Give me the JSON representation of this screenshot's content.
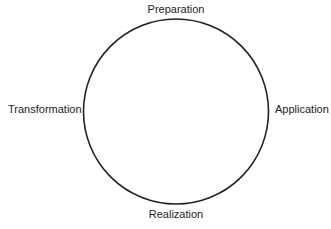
{
  "diagram": {
    "type": "cycle",
    "shape": "circle",
    "stroke_color": "#222222",
    "labels": {
      "top": "Preparation",
      "right": "Application",
      "bottom": "Realization",
      "left": "Transformation"
    }
  }
}
